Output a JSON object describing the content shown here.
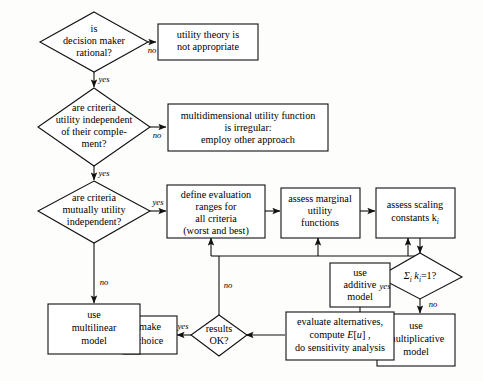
{
  "diagram": {
    "colors": {
      "background": "#fdfdfc",
      "stroke": "#111111",
      "node_fill": "#ffffff",
      "text": "#000000"
    },
    "nodes": {
      "d1": {
        "kind": "decision",
        "lines": [
          "is",
          "decision maker",
          "rational?"
        ]
      },
      "b1": {
        "kind": "process",
        "lines": [
          "utility theory is",
          "not appropriate"
        ]
      },
      "d2": {
        "kind": "decision",
        "lines": [
          "are  criteria",
          "utility independent",
          "of their comple-",
          "ment?"
        ]
      },
      "b2": {
        "kind": "process",
        "lines": [
          "multidimensional utility function",
          "is irregular:",
          "employ other approach"
        ]
      },
      "d3": {
        "kind": "decision",
        "lines": [
          "are  criteria",
          "mutually utility",
          "independent?"
        ]
      },
      "b3": {
        "kind": "process",
        "lines": [
          "define evaluation",
          "ranges for",
          "all criteria",
          "(worst and best)"
        ]
      },
      "b4": {
        "kind": "process",
        "lines": [
          "assess marginal",
          "utility",
          "functions"
        ]
      },
      "b5": {
        "kind": "process",
        "lines": [
          "assess scaling",
          "constants k"
        ],
        "subscript": "i"
      },
      "d4": {
        "kind": "decision",
        "expression": "Σ",
        "sub1": "i",
        "var": "k",
        "sub2": "i",
        "tail": "=1?"
      },
      "b6": {
        "kind": "process",
        "lines": [
          "use",
          "additive",
          "model"
        ]
      },
      "b7": {
        "kind": "process",
        "lines": [
          "use",
          "multiplicative",
          "model"
        ]
      },
      "b8": {
        "kind": "process",
        "lines": [
          "evaluate alternatives,",
          "compute E[u] ,",
          "do sensitivity analysis"
        ],
        "line2_pre": "compute ",
        "line2_math": "E",
        "line2_post": "[",
        "line2_math2": "u",
        "line2_post2": "] ,"
      },
      "d5": {
        "kind": "decision",
        "lines": [
          "results",
          "OK?"
        ]
      },
      "b9": {
        "kind": "process",
        "lines": [
          "make",
          "choice"
        ]
      },
      "b10": {
        "kind": "process",
        "lines": [
          "use",
          "multilinear",
          "model"
        ]
      }
    },
    "edge_labels": {
      "d1_no": "no",
      "d1_yes": "yes",
      "d2_no": "no",
      "d2_yes": "yes",
      "d3_yes": "yes",
      "d3_no": "no",
      "d4_yes": "yes",
      "d4_no": "no",
      "d5_yes": "yes",
      "d5_no": "no"
    }
  }
}
